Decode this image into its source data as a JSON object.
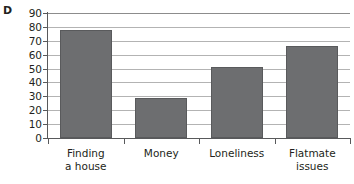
{
  "panel": {
    "letter": "D"
  },
  "chart_data": {
    "type": "bar",
    "title": "",
    "subtitle": "",
    "xlabel": "",
    "ylabel": "",
    "categories": [
      "Finding a house",
      "Money",
      "Loneliness",
      "Flatmate issues"
    ],
    "category_lines": [
      [
        "Finding",
        "a house"
      ],
      [
        "Money"
      ],
      [
        "Loneliness"
      ],
      [
        "Flatmate",
        "issues"
      ]
    ],
    "values": [
      78,
      29,
      51,
      66
    ],
    "ylim": [
      0,
      90
    ],
    "ytick_step": 10,
    "ytick_labels": [
      "90",
      "80",
      "70",
      "60",
      "50",
      "40",
      "30",
      "20",
      "10",
      "0"
    ],
    "ytick_values": [
      90,
      80,
      70,
      60,
      50,
      40,
      30,
      20,
      10,
      0
    ],
    "grid": "horizontal",
    "legend": "none",
    "bar_color": "#6d6e70",
    "bar_border_color": "#595a5c",
    "gridline_color": "#b3b3b3",
    "axis_color": "#58595b",
    "background": "#ffffff"
  }
}
